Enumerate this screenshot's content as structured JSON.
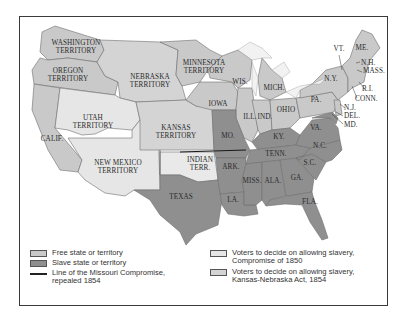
{
  "map": {
    "title": "Kansas-Nebraska Act, 1854",
    "colors": {
      "free": "#c9c9c9",
      "slave": "#8f8f8f",
      "compromise_1850": "#e6e6e6",
      "kansas_nebraska": "#d4d4d4",
      "water": "#ffffff",
      "missouri_line": "#1a1a1a"
    },
    "labels": {
      "washington": [
        "WASHINGTON",
        "TERRITORY"
      ],
      "oregon": [
        "OREGON",
        "TERRITORY"
      ],
      "nebraska": [
        "NEBRASKA",
        "TERRITORY"
      ],
      "minnesota": [
        "MINNESOTA",
        "TERRITORY"
      ],
      "utah": [
        "UTAH",
        "TERRITORY"
      ],
      "kansas": [
        "KANSAS",
        "TERRITORY"
      ],
      "new_mexico": [
        "NEW MEXICO",
        "TERRITORY"
      ],
      "indian": [
        "INDIAN",
        "TERR."
      ],
      "calif": "CALIF.",
      "texas": "TEXAS",
      "wis": "WIS.",
      "mich": "MICH.",
      "iowa": "IOWA",
      "ill": "ILL.",
      "ind": "IND.",
      "ohio": "OHIO",
      "mo": "MO.",
      "ky": "KY.",
      "tenn": "TENN.",
      "ark": "ARK.",
      "la": "LA.",
      "miss": "MISS.",
      "ala": "ALA.",
      "ga": "GA.",
      "fla": "FLA.",
      "sc": "S.C.",
      "nc": "N.C.",
      "va": "VA.",
      "pa": "PA.",
      "ny": "N.Y.",
      "vt": "VT.",
      "me": "ME.",
      "nh": "N.H.",
      "mass": "MASS.",
      "ri": "R.I.",
      "conn": "CONN.",
      "nj": "N.J.",
      "del": "DEL.",
      "md": "MD."
    }
  },
  "legend": {
    "items": [
      {
        "key": "free",
        "label": [
          "Free state or territory"
        ]
      },
      {
        "key": "slave",
        "label": [
          "Slave state or territory"
        ]
      },
      {
        "key": "missouri_line",
        "label": [
          "Line of the Missouri Compromise,",
          "repealed 1854"
        ]
      },
      {
        "key": "compromise_1850",
        "label": [
          "Voters to decide on allowing slavery,",
          "Compromise of 1850"
        ]
      },
      {
        "key": "kansas_nebraska",
        "label": [
          "Voters to decide on allowing slavery,",
          "Kansas-Nebraska Act, 1854"
        ]
      }
    ]
  }
}
